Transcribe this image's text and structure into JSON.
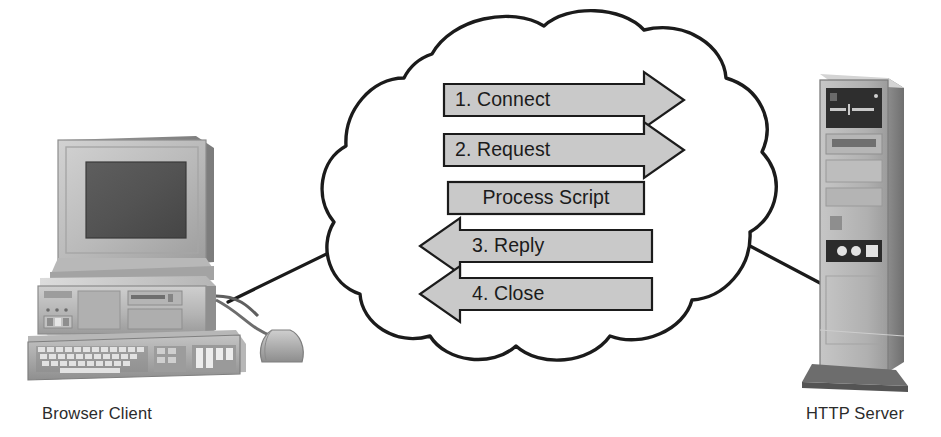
{
  "diagram": {
    "type": "network-sequence-diagram",
    "background_color": "#ffffff",
    "line_color": "#1b1b1b",
    "box_fill_color": "#c9c9c9",
    "box_stroke_color": "#1b1b1b",
    "text_color": "#1b1b1b"
  },
  "nodes": {
    "client": {
      "label": "Browser Client",
      "icon": "desktop-computer-icon",
      "parts": [
        "monitor",
        "desktop-case",
        "keyboard",
        "mouse"
      ]
    },
    "server": {
      "label": "HTTP Server",
      "icon": "tower-server-icon",
      "parts": [
        "tower-case",
        "tape-drive",
        "floppy-drive",
        "power-buttons",
        "base-plinth"
      ]
    },
    "cloud": {
      "label": "",
      "icon": "network-cloud-icon"
    }
  },
  "connectors": [
    {
      "name": "client-to-cloud",
      "from": "client",
      "to": "cloud"
    },
    {
      "name": "cloud-to-server",
      "from": "cloud",
      "to": "server"
    }
  ],
  "steps": [
    {
      "index": "1",
      "label": "1. Connect",
      "direction": "right",
      "shape": "arrow"
    },
    {
      "index": "2",
      "label": "2. Request",
      "direction": "right",
      "shape": "arrow"
    },
    {
      "index": "3",
      "label": "Process Script",
      "direction": "none",
      "shape": "box"
    },
    {
      "index": "4",
      "label": "3. Reply",
      "direction": "left",
      "shape": "arrow"
    },
    {
      "index": "5",
      "label": "4. Close",
      "direction": "left",
      "shape": "arrow"
    }
  ]
}
